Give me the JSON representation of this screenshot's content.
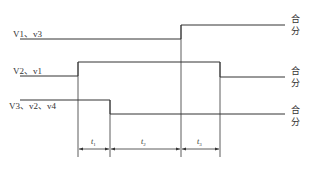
{
  "diagram": {
    "type": "timing-diagram",
    "signals": [
      {
        "label": "V1、v3",
        "states": [
          "分",
          "合"
        ],
        "transitions_at": [
          "t1+t2 end"
        ],
        "initial": "low",
        "final": "high"
      },
      {
        "label": "V2、v1",
        "states": [
          "分",
          "合"
        ],
        "transitions_at": [
          "t1 start (rise)",
          "t3 end (fall)"
        ],
        "initial": "low",
        "final": "low"
      },
      {
        "label": "V3、v2、v4",
        "states": [
          "分",
          "合"
        ],
        "transitions_at": [
          "t1 end (fall)"
        ],
        "initial": "high",
        "final": "low"
      }
    ],
    "state_labels": [
      {
        "top": "合",
        "bottom": "分"
      },
      {
        "top": "合",
        "bottom": "分"
      },
      {
        "top": "合",
        "bottom": "分"
      }
    ],
    "intervals": [
      {
        "name": "t",
        "sub": "1"
      },
      {
        "name": "t",
        "sub": "2"
      },
      {
        "name": "t",
        "sub": "3"
      }
    ],
    "line_color": "#333333"
  }
}
